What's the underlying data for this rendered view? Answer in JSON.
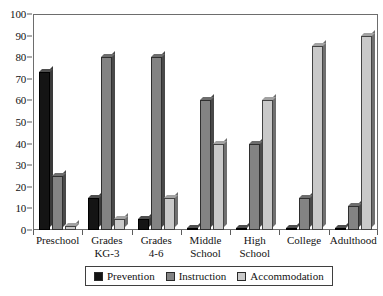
{
  "chart_data": {
    "type": "bar",
    "title": "",
    "subtitle": "",
    "xlabel": "",
    "ylabel": "",
    "ylim": [
      0,
      100
    ],
    "yticks": [
      0,
      10,
      20,
      30,
      40,
      50,
      60,
      70,
      80,
      90,
      100
    ],
    "grid": false,
    "legend_position": "bottom",
    "categories": [
      "Preschool",
      "Grades KG-3",
      "Grades 4-6",
      "Middle School",
      "High School",
      "College",
      "Adulthood"
    ],
    "category_lines": [
      [
        "Preschool"
      ],
      [
        "Grades",
        "KG-3"
      ],
      [
        "Grades",
        "4-6"
      ],
      [
        "Middle",
        "School"
      ],
      [
        "High",
        "School"
      ],
      [
        "College"
      ],
      [
        "Adulthood"
      ]
    ],
    "series": [
      {
        "name": "Prevention",
        "color": "#141414",
        "values": [
          73,
          15,
          5,
          1,
          1,
          1,
          1
        ]
      },
      {
        "name": "Instruction",
        "color": "#838383",
        "values": [
          25,
          80,
          80,
          60,
          40,
          15,
          11
        ]
      },
      {
        "name": "Accommodation",
        "color": "#c9c9c9",
        "values": [
          2,
          5,
          15,
          40,
          60,
          85,
          90
        ]
      }
    ]
  },
  "legend": {
    "items": [
      {
        "label": "Prevention",
        "key": "prevention"
      },
      {
        "label": "Instruction",
        "key": "instruction"
      },
      {
        "label": "Accommodation",
        "key": "accommodation"
      }
    ]
  }
}
